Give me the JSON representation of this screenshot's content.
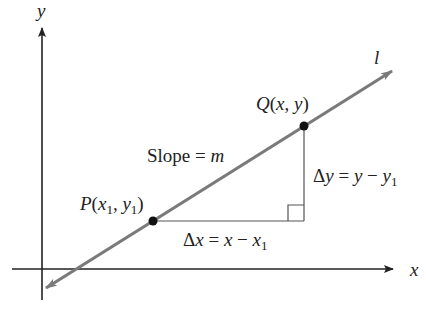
{
  "diagram": {
    "axes": {
      "x_label": "x",
      "y_label": "y"
    },
    "line_label": "l",
    "slope_label": {
      "prefix": "Slope = ",
      "var": "m"
    },
    "point_p": {
      "name": "P",
      "label_text": "P(x1, y1)",
      "open": "(",
      "x": "x",
      "sub1": "1",
      "comma": ", ",
      "y": "y",
      "sub2": "1",
      "close": ")"
    },
    "point_q": {
      "name": "Q",
      "label_text": "Q(x, y)",
      "open": "(",
      "x": "x",
      "comma": ", ",
      "y": "y",
      "close": ")"
    },
    "delta_x": {
      "delta": "Δ",
      "var": "x",
      "eq": " = ",
      "rhs_a": "x",
      "minus": " − ",
      "rhs_b": "x",
      "sub": "1"
    },
    "delta_y": {
      "delta": "Δ",
      "var": "y",
      "eq": " = ",
      "rhs_a": "y",
      "minus": " − ",
      "rhs_b": "y",
      "sub": "1"
    },
    "colors": {
      "axis": "#222222",
      "line": "#7a7a7a",
      "triangle": "#555555",
      "point": "#111111"
    }
  }
}
